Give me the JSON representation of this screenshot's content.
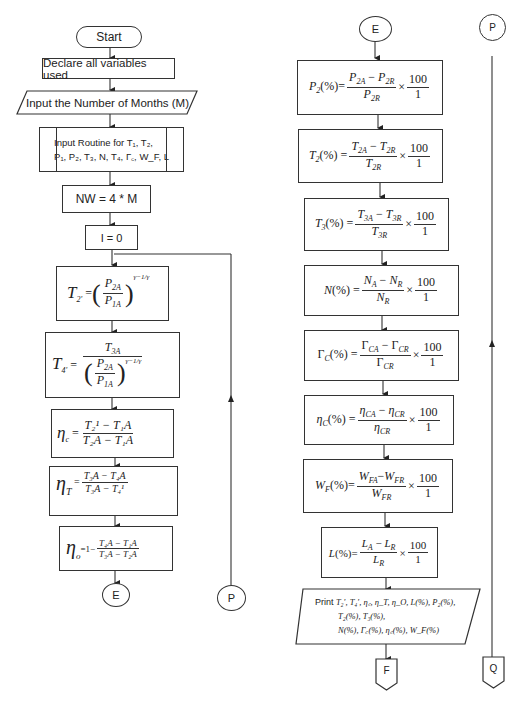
{
  "flowchart": {
    "left_column": {
      "start": "Start",
      "declare": "Declare all variables used",
      "input_months": "Input the Number of Months (M)",
      "input_routine_line1": "Input Routine for T₁, T₂,",
      "input_routine_line2": "P₁, P₂, T₃, N, T₄, Γ꜀, W_F, L",
      "nw": "NW = 4 * M",
      "i_init": "I = 0",
      "t2_prime": {
        "lhs": "T",
        "lhs_sub": "2'",
        "num": "P",
        "num_sub": "2A",
        "den": "P",
        "den_sub": "1A",
        "exp": "γ−1/γ"
      },
      "t4_prime": {
        "lhs": "T",
        "lhs_sub": "4'",
        "num": "T",
        "num_sub": "3A",
        "inner_num": "P",
        "inner_num_sub": "2A",
        "inner_den": "P",
        "inner_den_sub": "1A",
        "exp": "γ−1/γ"
      },
      "eta_c": {
        "lhs": "η",
        "lhs_sub": "c",
        "num": "T₂¹ − T₁A",
        "den": "T₂A − T₁A"
      },
      "eta_t": {
        "lhs": "η",
        "lhs_sub": "T",
        "num": "T₃A − T₄A",
        "den": "T₃A − T₄¹"
      },
      "eta_o": {
        "lhs": "η",
        "lhs_sub": "o",
        "prefix": "=1−",
        "num": "T₄A − T₁A",
        "den": "T₃A − T₂A"
      },
      "connector_end": "E",
      "connector_loop": "P"
    },
    "middle_column": {
      "connector_start": "E",
      "formulas": [
        {
          "lhs": "P",
          "lhs_sub": "2",
          "num_a": "P",
          "num_a_sub": "2A",
          "num_b": "P",
          "num_b_sub": "2R",
          "den": "P",
          "den_sub": "2R"
        },
        {
          "lhs": "T",
          "lhs_sub": "2",
          "num_a": "T",
          "num_a_sub": "2A",
          "num_b": "T",
          "num_b_sub": "2R",
          "den": "T",
          "den_sub": "2R"
        },
        {
          "lhs": "T",
          "lhs_sub": "3",
          "num_a": "T",
          "num_a_sub": "3A",
          "num_b": "T",
          "num_b_sub": "3R",
          "den": "T",
          "den_sub": "3R"
        },
        {
          "lhs": "N",
          "lhs_sub": "",
          "num_a": "N",
          "num_a_sub": "A",
          "num_b": "N",
          "num_b_sub": "R",
          "den": "N",
          "den_sub": "R"
        },
        {
          "lhs": "Γ",
          "lhs_sub": "C",
          "num_a": "Γ",
          "num_a_sub": "CA",
          "num_b": "Γ",
          "num_b_sub": "CR",
          "den": "Γ",
          "den_sub": "CR"
        },
        {
          "lhs": "η",
          "lhs_sub": "C",
          "num_a": "η",
          "num_a_sub": "CA",
          "num_b": "η",
          "num_b_sub": "CR",
          "den": "η",
          "den_sub": "CR"
        },
        {
          "lhs": "W",
          "lhs_sub": "F",
          "num_a": "W",
          "num_a_sub": "FA",
          "num_b": "W",
          "num_b_sub": "FR",
          "den": "W",
          "den_sub": "FR"
        },
        {
          "lhs": "L",
          "lhs_sub": "",
          "num_a": "L",
          "num_a_sub": "A",
          "num_b": "L",
          "num_b_sub": "R",
          "den": "L",
          "den_sub": "R"
        }
      ],
      "pct": "(%)",
      "eq": "=",
      "minus": "−",
      "times": "×",
      "hundred": "100",
      "one": "1",
      "print_label": "Print",
      "print_line1": "T₂', T₄', η꜀, η_T, η_O, L(%), P₂(%),",
      "print_line2": "T₂(%), T₃(%),",
      "print_line3": "N(%), Γ꜀(%), η꜀(%), W_F(%)",
      "offpage_end": "F"
    },
    "right_column": {
      "connector_start": "P",
      "offpage_end": "Q"
    }
  }
}
